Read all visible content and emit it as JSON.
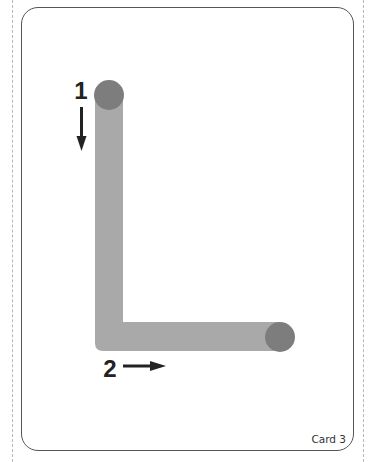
{
  "card": {
    "label": "Card 3",
    "letter": "L"
  },
  "strokes": [
    {
      "order": "1",
      "direction": "down",
      "arrow_icon": "arrow-down-icon"
    },
    {
      "order": "2",
      "direction": "right",
      "arrow_icon": "arrow-right-icon"
    }
  ],
  "colors": {
    "stroke_fill": "#a9a9a9",
    "start_dot": "#7d7d7d",
    "ink": "#222222",
    "border": "#555555",
    "cut_line": "#b8b8b8"
  }
}
